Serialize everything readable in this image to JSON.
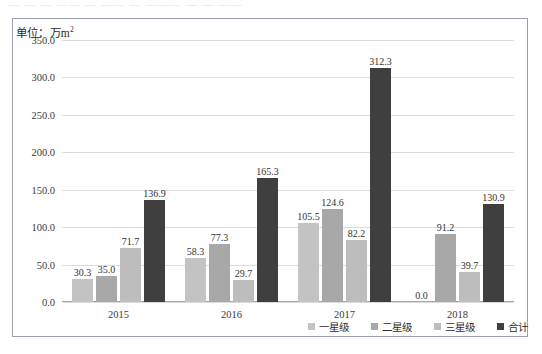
{
  "top_cut_text": "— — —  ——  — —— —  ———  — —  ——",
  "unit_label": "单位：万m",
  "unit_sup": "2",
  "legend_position": "bottom-right",
  "colors": {
    "series_1": "#c3c3c3",
    "series_2": "#a8a8a8",
    "series_3": "#bdbdbd",
    "series_total": "#3f3f3f",
    "grid": "#dcdcdc",
    "frame": "#9aa0b0",
    "text": "#2b2b2b"
  },
  "chart_data": {
    "type": "bar",
    "title": "",
    "subtitle": "",
    "xlabel": "",
    "ylabel": "单位：万m2",
    "categories": [
      "2015",
      "2016",
      "2017",
      "2018"
    ],
    "ylim": [
      0.0,
      350.0
    ],
    "ytick_step": 50.0,
    "ytick_labels": [
      "350.0",
      "300.0",
      "250.0",
      "200.0",
      "150.0",
      "100.0",
      "50.0",
      "0.0"
    ],
    "ytick_values": [
      350.0,
      300.0,
      250.0,
      200.0,
      150.0,
      100.0,
      50.0,
      0.0
    ],
    "grid": true,
    "legend": [
      "一星级",
      "二星级",
      "三星级",
      "合计"
    ],
    "series": [
      {
        "name": "一星级",
        "color": "#c3c3c3",
        "values": [
          30.3,
          58.3,
          105.5,
          0.0
        ],
        "labels": [
          "30.3",
          "58.3",
          "105.5",
          "0.0"
        ]
      },
      {
        "name": "二星级",
        "color": "#a8a8a8",
        "values": [
          35.0,
          77.3,
          124.6,
          91.2
        ],
        "labels": [
          "35.0",
          "77.3",
          "124.6",
          "91.2"
        ]
      },
      {
        "name": "三星级",
        "color": "#bdbdbd",
        "values": [
          71.7,
          29.7,
          82.2,
          39.7
        ],
        "labels": [
          "71.7",
          "29.7",
          "82.2",
          "39.7"
        ]
      },
      {
        "name": "合计",
        "color": "#3f3f3f",
        "values": [
          136.9,
          165.3,
          312.3,
          130.9
        ],
        "labels": [
          "136.9",
          "165.3",
          "312.3",
          "130.9"
        ]
      }
    ]
  }
}
